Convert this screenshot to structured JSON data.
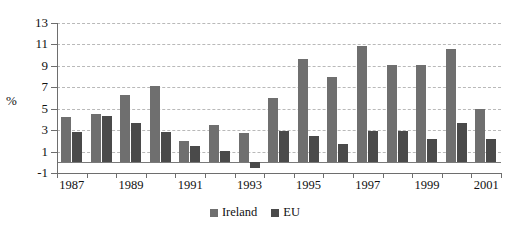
{
  "chart_data": {
    "type": "bar",
    "title": "",
    "subtitle": "",
    "xlabel": "",
    "ylabel": "%",
    "ylim": [
      -1,
      13
    ],
    "ytick_labels": [
      "13",
      "11",
      "9",
      "7",
      "5",
      "3",
      "1",
      "-1"
    ],
    "yticks": [
      13,
      11,
      9,
      7,
      5,
      3,
      1,
      -1
    ],
    "grid": true,
    "legend_position": "bottom-center",
    "categories": [
      "1987",
      "1988",
      "1989",
      "1990",
      "1991",
      "1992",
      "1993",
      "1994",
      "1995",
      "1996",
      "1997",
      "1998",
      "1999",
      "2000",
      "2001"
    ],
    "visible_tick_labels": [
      "1987",
      "1989",
      "1991",
      "1993",
      "1995",
      "1997",
      "1999",
      "2001"
    ],
    "series": [
      {
        "name": "Ireland",
        "color": "#6f6f6f",
        "values": [
          4.2,
          4.5,
          6.3,
          7.1,
          2.0,
          3.5,
          2.7,
          6.0,
          9.6,
          8.0,
          10.9,
          9.1,
          9.1,
          10.6,
          5.0
        ]
      },
      {
        "name": "EU",
        "color": "#4a4a4a",
        "values": [
          2.8,
          4.3,
          3.7,
          2.8,
          1.5,
          1.1,
          -0.5,
          2.9,
          2.5,
          1.7,
          2.9,
          2.9,
          2.2,
          3.7,
          2.2
        ]
      }
    ]
  },
  "legend": {
    "items": [
      {
        "label": "Ireland",
        "key": "ireland"
      },
      {
        "label": "EU",
        "key": "eu"
      }
    ]
  },
  "axis": {
    "y_title": "%"
  },
  "colors": {
    "ireland": "#6f6f6f",
    "eu": "#4a4a4a",
    "grid": "#b9b9b9",
    "axis": "#6e6e6e",
    "background": "#ffffff",
    "text": "#111111"
  }
}
